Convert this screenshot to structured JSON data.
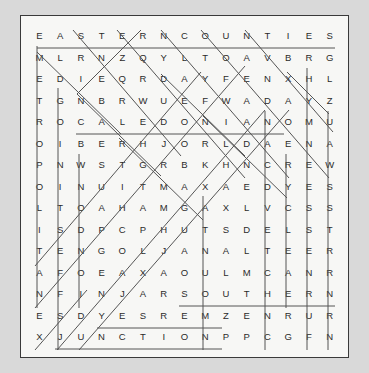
{
  "puzzle": {
    "type": "word-search",
    "rows": 15,
    "cols": 15,
    "grid": [
      [
        "E",
        "A",
        "S",
        "T",
        "E",
        "R",
        "N",
        "C",
        "O",
        "U",
        "N",
        "T",
        "I",
        "E",
        "S"
      ],
      [
        "M",
        "L",
        "R",
        "N",
        "Z",
        "Q",
        "Y",
        "L",
        "T",
        "O",
        "A",
        "V",
        "B",
        "R",
        "G"
      ],
      [
        "E",
        "D",
        "I",
        "E",
        "Q",
        "R",
        "D",
        "A",
        "Y",
        "F",
        "E",
        "N",
        "X",
        "H",
        "L"
      ],
      [
        "T",
        "G",
        "N",
        "B",
        "R",
        "W",
        "U",
        "E",
        "F",
        "W",
        "A",
        "D",
        "A",
        "Y",
        "Z"
      ],
      [
        "R",
        "O",
        "C",
        "A",
        "L",
        "E",
        "D",
        "O",
        "N",
        "I",
        "A",
        "N",
        "O",
        "M",
        "U"
      ],
      [
        "O",
        "I",
        "B",
        "E",
        "R",
        "H",
        "J",
        "O",
        "R",
        "L",
        "D",
        "A",
        "E",
        "N",
        "A"
      ],
      [
        "P",
        "N",
        "W",
        "S",
        "T",
        "G",
        "R",
        "B",
        "K",
        "H",
        "N",
        "C",
        "R",
        "E",
        "W"
      ],
      [
        "O",
        "I",
        "N",
        "U",
        "I",
        "T",
        "M",
        "A",
        "X",
        "A",
        "E",
        "D",
        "Y",
        "E",
        "S"
      ],
      [
        "L",
        "T",
        "O",
        "A",
        "H",
        "A",
        "M",
        "G",
        "A",
        "X",
        "L",
        "V",
        "C",
        "S",
        "S"
      ],
      [
        "I",
        "S",
        "D",
        "P",
        "C",
        "P",
        "H",
        "U",
        "T",
        "S",
        "D",
        "E",
        "L",
        "S",
        "T"
      ],
      [
        "T",
        "E",
        "N",
        "G",
        "O",
        "L",
        "J",
        "A",
        "N",
        "A",
        "L",
        "T",
        "E",
        "E",
        "R"
      ],
      [
        "A",
        "F",
        "O",
        "E",
        "A",
        "X",
        "A",
        "O",
        "U",
        "L",
        "M",
        "C",
        "A",
        "N",
        "R"
      ],
      [
        "N",
        "F",
        "I",
        "N",
        "J",
        "A",
        "R",
        "S",
        "O",
        "U",
        "T",
        "H",
        "E",
        "R",
        "N"
      ],
      [
        "E",
        "S",
        "D",
        "Y",
        "E",
        "S",
        "R",
        "E",
        "M",
        "Z",
        "E",
        "N",
        "R",
        "U",
        "R"
      ],
      [
        "X",
        "J",
        "U",
        "N",
        "C",
        "T",
        "I",
        "O",
        "N",
        "P",
        "P",
        "C",
        "G",
        "F",
        "N"
      ]
    ],
    "found_words": [
      {
        "word": "EASTERN COUNTIES",
        "orientation": "horizontal",
        "start": [
          0,
          0
        ],
        "end": [
          0,
          14
        ]
      },
      {
        "word": "CALEDONIAN",
        "orientation": "horizontal",
        "start": [
          4,
          2
        ],
        "end": [
          4,
          11
        ]
      },
      {
        "word": "SOUTHERN",
        "orientation": "horizontal",
        "start": [
          12,
          7
        ],
        "end": [
          12,
          14
        ]
      },
      {
        "word": "MERSEY",
        "orientation": "horizontal-reverse",
        "start": [
          13,
          3
        ],
        "end": [
          13,
          8
        ]
      },
      {
        "word": "JUNCTION",
        "orientation": "horizontal",
        "start": [
          14,
          1
        ],
        "end": [
          14,
          8
        ]
      },
      {
        "word": "METROPOLITAN",
        "orientation": "vertical",
        "start": [
          0,
          0
        ],
        "end": [
          13,
          0
        ]
      },
      {
        "word": "DIGONITSEF",
        "orientation": "vertical",
        "start": [
          2,
          1
        ],
        "end": [
          14,
          1
        ]
      },
      {
        "word": "NCONDOITS",
        "orientation": "vertical",
        "start": [
          5,
          2
        ],
        "end": [
          12,
          2
        ]
      },
      {
        "word": "NORTHERN",
        "orientation": "vertical",
        "start": [
          7,
          8
        ],
        "end": [
          14,
          8
        ]
      },
      {
        "word": "DANCE",
        "orientation": "vertical",
        "start": [
          3,
          11
        ],
        "end": [
          14,
          11
        ]
      },
      {
        "word": "ADANCEVELCHNC",
        "orientation": "vertical",
        "start": [
          2,
          12
        ],
        "end": [
          14,
          12
        ]
      },
      {
        "word": "GREAT",
        "orientation": "vertical",
        "start": [
          1,
          13
        ],
        "end": [
          14,
          13
        ]
      },
      {
        "word": "WESTERN",
        "orientation": "vertical",
        "start": [
          3,
          14
        ],
        "end": [
          14,
          14
        ]
      },
      {
        "word": "DIAGONAL-1",
        "orientation": "diagonal-down",
        "start": [
          0,
          2
        ],
        "end": [
          5,
          7
        ]
      },
      {
        "word": "DIAGONAL-2",
        "orientation": "diagonal-up",
        "start": [
          4,
          2
        ],
        "end": [
          0,
          6
        ]
      }
    ]
  },
  "colors": {
    "page_background": "#d9d9d9",
    "panel_background": "#f7f7f5",
    "panel_border": "#3a3a3a",
    "letter": "#2b2b2b",
    "strike": "#555555"
  }
}
